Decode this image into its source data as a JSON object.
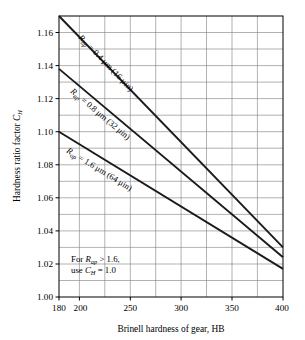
{
  "chart_data": {
    "type": "line",
    "title": "",
    "xlabel": "Brinell hardness of gear, HB",
    "ylabel": "Hardness ratio factor C_H",
    "xlim": [
      180,
      400
    ],
    "ylim": [
      1.0,
      1.17
    ],
    "grid": true,
    "legend_position": "inline-curve-labels",
    "x_ticks": [
      180,
      200,
      250,
      300,
      350,
      400
    ],
    "x_tick_labels": [
      "180",
      "200",
      "250",
      "300",
      "350",
      "400"
    ],
    "x_gridlines": [
      200,
      225,
      250,
      275,
      300,
      325,
      350,
      375
    ],
    "y_ticks": [
      1.0,
      1.02,
      1.04,
      1.06,
      1.08,
      1.1,
      1.12,
      1.14,
      1.16
    ],
    "y_tick_labels": [
      "1.00",
      "1.02",
      "1.04",
      "1.06",
      "1.08",
      "1.10",
      "1.12",
      "1.14",
      "1.16"
    ],
    "y_gridlines": [
      1.01,
      1.02,
      1.03,
      1.04,
      1.05,
      1.06,
      1.07,
      1.08,
      1.09,
      1.1,
      1.11,
      1.12,
      1.13,
      1.14,
      1.15,
      1.16
    ],
    "series": [
      {
        "name": "Rap = 0.4 um (16 uin)",
        "x": [
          180,
          400
        ],
        "values": [
          1.17,
          1.03
        ]
      },
      {
        "name": "Rap = 0.8 um (32 uin)",
        "x": [
          180,
          400
        ],
        "values": [
          1.138,
          1.024
        ]
      },
      {
        "name": "Rap = 1.6 um (64 uin)",
        "x": [
          180,
          400
        ],
        "values": [
          1.1,
          1.017
        ]
      }
    ],
    "annotations": [
      {
        "text": "For Rap > 1.6, use CH = 1.0",
        "x": 232,
        "y": 1.022
      }
    ]
  },
  "axes": {
    "y_title_main": "Hardness ratio factor ",
    "y_title_var": "C",
    "y_title_sub": "H",
    "x_title": "Brinell hardness of gear, HB"
  },
  "curve_labels": [
    {
      "var": "R",
      "var_sub": "ap",
      "eq": " = 0.4 ",
      "unit": "μm (16 μin)"
    },
    {
      "var": "R",
      "var_sub": "ap",
      "eq": " = 0.8 ",
      "unit": "μm (32 μin)"
    },
    {
      "var": "R",
      "var_sub": "ap",
      "eq": " = 1.6 ",
      "unit": "μm (64 μin)"
    }
  ],
  "note": {
    "line1_pre": "For ",
    "line1_var": "R",
    "line1_sub": "ap",
    "line1_post": " > 1.6,",
    "line2_pre": "use ",
    "line2_var": "C",
    "line2_sub": "H",
    "line2_post": " = 1.0"
  },
  "y_tick_labels": {
    "t0": "1.00",
    "t1": "1.02",
    "t2": "1.04",
    "t3": "1.06",
    "t4": "1.08",
    "t5": "1.10",
    "t6": "1.12",
    "t7": "1.14",
    "t8": "1.16"
  },
  "x_tick_labels": {
    "t0": "180",
    "t1": "200",
    "t2": "250",
    "t3": "300",
    "t4": "350",
    "t5": "400"
  }
}
